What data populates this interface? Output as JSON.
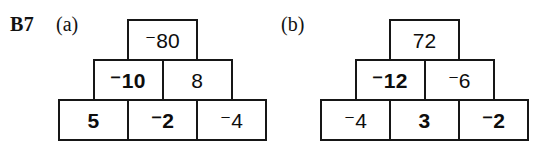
{
  "worksheet": {
    "question_label": "B7",
    "part_a_label": "(a)",
    "part_b_label": "(b)"
  },
  "pyramid_a": {
    "name": "number-pyramid-a",
    "top_row": [
      {
        "value": "⁻80",
        "weight": "regular"
      }
    ],
    "middle_row": [
      {
        "value": "⁻10",
        "weight": "bold"
      },
      {
        "value": "8",
        "weight": "regular"
      }
    ],
    "bottom_row": [
      {
        "value": "5",
        "weight": "bold"
      },
      {
        "value": "⁻2",
        "weight": "bold"
      },
      {
        "value": "⁻4",
        "weight": "regular"
      }
    ]
  },
  "pyramid_b": {
    "name": "number-pyramid-b",
    "top_row": [
      {
        "value": "72",
        "weight": "regular"
      }
    ],
    "middle_row": [
      {
        "value": "⁻12",
        "weight": "bold"
      },
      {
        "value": "⁻6",
        "weight": "regular"
      }
    ],
    "bottom_row": [
      {
        "value": "⁻4",
        "weight": "regular"
      },
      {
        "value": "3",
        "weight": "bold"
      },
      {
        "value": "⁻2",
        "weight": "bold"
      }
    ]
  },
  "colors": {
    "ink": "#121212",
    "border": "#161616",
    "paper": "#ffffff"
  }
}
